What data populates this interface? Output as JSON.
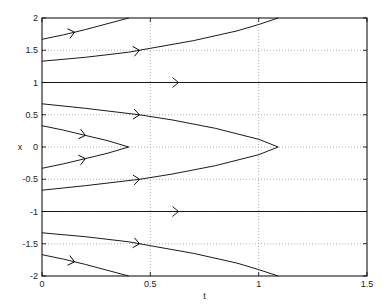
{
  "chart_data": {
    "type": "line",
    "title": "",
    "xlabel": "t",
    "ylabel": "x",
    "xlim": [
      0,
      1.5
    ],
    "ylim": [
      -2,
      2
    ],
    "grid": true,
    "legend": null,
    "x_ticks": [
      0,
      0.5,
      1,
      1.5
    ],
    "x_tick_labels": [
      "0",
      "0.5",
      "1",
      "1.5"
    ],
    "y_ticks": [
      -2,
      -1.5,
      -1,
      -0.5,
      0,
      0.5,
      1,
      1.5,
      2
    ],
    "y_tick_labels": [
      "-2",
      "-1.5",
      "-1",
      "-0.5",
      "0",
      "0.5",
      "1",
      "1.5",
      "2"
    ],
    "series": [
      {
        "name": "x0=1.67",
        "x": [
          0,
          0.1,
          0.2,
          0.3,
          0.4
        ],
        "y": [
          1.67,
          1.74,
          1.82,
          1.91,
          2.0
        ],
        "arrow_at": 0.15
      },
      {
        "name": "x0=1.33",
        "x": [
          0,
          0.2,
          0.4,
          0.5,
          0.7,
          0.9,
          1.0,
          1.09
        ],
        "y": [
          1.33,
          1.39,
          1.47,
          1.53,
          1.65,
          1.8,
          1.9,
          2.0
        ],
        "arrow_at": 0.45
      },
      {
        "name": "x0=1",
        "x": [
          0,
          1.5
        ],
        "y": [
          1,
          1
        ],
        "arrow_at": 0.63
      },
      {
        "name": "x0=0.67",
        "x": [
          0,
          0.2,
          0.45,
          0.6,
          0.8,
          1.0,
          1.09
        ],
        "y": [
          0.67,
          0.6,
          0.5,
          0.42,
          0.29,
          0.12,
          0.0
        ],
        "arrow_at": 0.45
      },
      {
        "name": "x0=0.33",
        "x": [
          0,
          0.1,
          0.2,
          0.3,
          0.4
        ],
        "y": [
          0.33,
          0.26,
          0.18,
          0.1,
          0.0
        ],
        "arrow_at": 0.2
      },
      {
        "name": "x0=-0.33",
        "x": [
          0,
          0.1,
          0.2,
          0.3,
          0.4
        ],
        "y": [
          -0.33,
          -0.26,
          -0.18,
          -0.1,
          0.0
        ],
        "arrow_at": 0.2
      },
      {
        "name": "x0=-0.67",
        "x": [
          0,
          0.2,
          0.45,
          0.6,
          0.8,
          1.0,
          1.09
        ],
        "y": [
          -0.67,
          -0.6,
          -0.5,
          -0.42,
          -0.29,
          -0.12,
          0.0
        ],
        "arrow_at": 0.45
      },
      {
        "name": "x0=-1",
        "x": [
          0,
          1.5
        ],
        "y": [
          -1,
          -1
        ],
        "arrow_at": 0.63
      },
      {
        "name": "x0=-1.33",
        "x": [
          0,
          0.2,
          0.4,
          0.5,
          0.7,
          0.9,
          1.0,
          1.09
        ],
        "y": [
          -1.33,
          -1.39,
          -1.47,
          -1.53,
          -1.65,
          -1.8,
          -1.9,
          -2.0
        ],
        "arrow_at": 0.45
      },
      {
        "name": "x0=-1.67",
        "x": [
          0,
          0.1,
          0.2,
          0.3,
          0.4
        ],
        "y": [
          -1.67,
          -1.74,
          -1.82,
          -1.91,
          -2.0
        ],
        "arrow_at": 0.15
      }
    ]
  },
  "style": {
    "line_color": "#000000",
    "grid_color": "#9a9a9a",
    "axis_color": "#000000"
  }
}
